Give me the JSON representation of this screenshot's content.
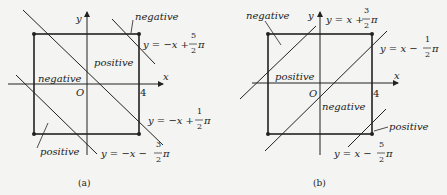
{
  "panels": [
    {
      "caption": "(a)",
      "axes": {
        "x": "x",
        "y": "y",
        "origin": "O",
        "x_tick": "4"
      },
      "regions": [
        "negative",
        "positive",
        "negative",
        "positive"
      ],
      "lines": [
        {
          "lhs": "y = −x + ",
          "num": "5",
          "den": "2",
          "pi": "π"
        },
        {
          "lhs": "y = −x + ",
          "num": "1",
          "den": "2",
          "pi": "π"
        },
        {
          "lhs": "y = −x − ",
          "num": "3",
          "den": "2",
          "pi": "π"
        }
      ]
    },
    {
      "caption": "(b)",
      "axes": {
        "x": "x",
        "y": "y",
        "origin": "O",
        "x_tick": "4"
      },
      "regions": [
        "negative",
        "positive",
        "negative",
        "positive"
      ],
      "lines": [
        {
          "lhs": "y = x + ",
          "num": "3",
          "den": "2",
          "pi": "π"
        },
        {
          "lhs": "y = x − ",
          "num": "1",
          "den": "2",
          "pi": "π"
        },
        {
          "lhs": "y = x − ",
          "num": "5",
          "den": "2",
          "pi": "π"
        }
      ]
    }
  ]
}
